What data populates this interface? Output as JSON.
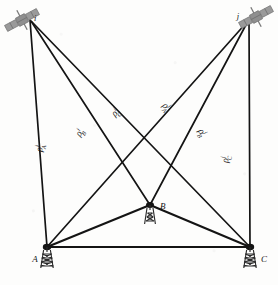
{
  "figure": {
    "title": "",
    "background_color": "#fdfdfc",
    "line_color": "#141414",
    "satellite_color": "#8f8f8f"
  },
  "satellites": [
    {
      "id": "sat-i",
      "label": "i",
      "icon": "satellite-icon",
      "x": 30,
      "y": 20,
      "label_x": 34,
      "label_y": 18
    },
    {
      "id": "sat-j",
      "label": "j",
      "icon": "satellite-icon",
      "x": 248,
      "y": 18,
      "label_x": 240,
      "label_y": 16
    }
  ],
  "stations": [
    {
      "id": "station-a",
      "label": "A",
      "icon": "antenna-tower-icon",
      "x": 47,
      "y": 247,
      "label_x": 35,
      "label_y": 262
    },
    {
      "id": "station-b",
      "label": "B",
      "icon": "antenna-tower-icon",
      "x": 150,
      "y": 205,
      "label_x": 160,
      "label_y": 208
    },
    {
      "id": "station-c",
      "label": "C",
      "icon": "antenna-tower-icon",
      "x": 250,
      "y": 247,
      "label_x": 261,
      "label_y": 262
    }
  ],
  "ranges": [
    {
      "id": "rho-i-A",
      "base": "ρ",
      "sup": "i",
      "sub": "A",
      "from": "sat-i",
      "to": "station-a",
      "label_x": 42,
      "label_y": 152
    },
    {
      "id": "rho-i-B",
      "base": "ρ",
      "sup": "i",
      "sub": "B",
      "from": "sat-i",
      "to": "station-b",
      "label_x": 80,
      "label_y": 137
    },
    {
      "id": "rho-i-C",
      "base": "ρ",
      "sup": "i",
      "sub": "C",
      "from": "sat-i",
      "to": "station-c",
      "label_x": 115,
      "label_y": 117
    },
    {
      "id": "rho-j-A",
      "base": "ρ",
      "sup": "j",
      "sub": "A",
      "from": "sat-j",
      "to": "station-a",
      "label_x": 162,
      "label_y": 106
    },
    {
      "id": "rho-j-B",
      "base": "ρ",
      "sup": "j",
      "sub": "B",
      "from": "sat-j",
      "to": "station-b",
      "label_x": 198,
      "label_y": 131
    },
    {
      "id": "rho-j-C",
      "base": "ρ",
      "sup": "j",
      "sub": "C",
      "from": "sat-j",
      "to": "station-c",
      "label_x": 228,
      "label_y": 163
    }
  ],
  "baselines": [
    {
      "id": "baseline-a-b",
      "from": "station-a",
      "to": "station-b"
    },
    {
      "id": "baseline-b-c",
      "from": "station-b",
      "to": "station-c"
    },
    {
      "id": "baseline-a-c",
      "from": "station-a",
      "to": "station-c"
    }
  ]
}
